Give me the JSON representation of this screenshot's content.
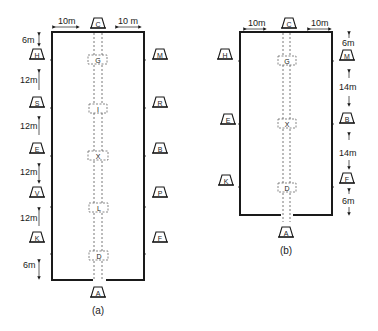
{
  "diagram_a": {
    "caption": "(a)",
    "top_letter": "C",
    "bottom_letter": "A",
    "top_left_dim": "10m",
    "top_right_dim": "10 m",
    "left_letters": [
      "H",
      "S",
      "E",
      "V",
      "K"
    ],
    "right_letters": [
      "M",
      "R",
      "B",
      "P",
      "F"
    ],
    "center_letters": [
      "G",
      "I",
      "X",
      "L",
      "D"
    ],
    "spacing_labels": [
      "6m",
      "12m",
      "12m",
      "12m",
      "12m",
      "6m"
    ]
  },
  "diagram_b": {
    "caption": "(b)",
    "top_letter": "C",
    "bottom_letter": "A",
    "top_left_dim": "10m",
    "top_right_dim": "10m",
    "left_letters": [
      "H",
      "E",
      "K"
    ],
    "right_letters": [
      "M",
      "B",
      "F"
    ],
    "center_letters": [
      "G",
      "X",
      "D"
    ],
    "spacing_labels": [
      "6m",
      "14m",
      "14m",
      "6m"
    ]
  }
}
